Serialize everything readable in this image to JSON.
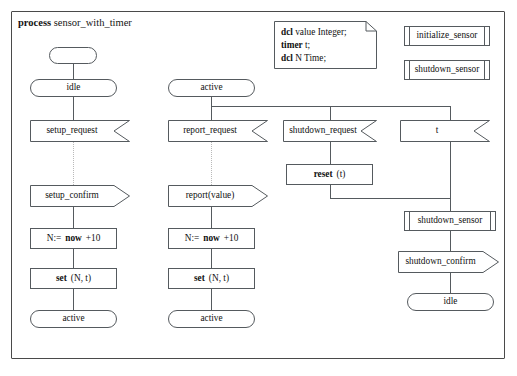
{
  "diagram": {
    "kind": "sdl-process-diagram",
    "header": {
      "keyword": "process",
      "name": "sensor_with_timer"
    },
    "declaration_note": {
      "lines": [
        {
          "keyword": "dcl",
          "text": "value Integer;"
        },
        {
          "keyword": "timer",
          "text": "t;"
        },
        {
          "keyword": "dcl",
          "text": "N Time;"
        }
      ]
    },
    "procedure_refs": [
      {
        "label": "initialize_sensor"
      },
      {
        "label": "shutdown_sensor"
      }
    ],
    "branches": {
      "setup": {
        "start": "",
        "state_in": "idle",
        "input": "setup_request",
        "output": "setup_confirm",
        "task_assign_prefix": "N:=",
        "task_assign_keyword": "now",
        "task_assign_suffix": "+10",
        "task_set_keyword": "set",
        "task_set_args": "(N, t)",
        "state_out": "active"
      },
      "report": {
        "state_in": "active",
        "input": "report_request",
        "output": "report(value)",
        "task_assign_prefix": "N:=",
        "task_assign_keyword": "now",
        "task_assign_suffix": "+10",
        "task_set_keyword": "set",
        "task_set_args": "(N, t)",
        "state_out": "active"
      },
      "shutdown": {
        "input": "shutdown_request",
        "task_reset_keyword": "reset",
        "task_reset_args": "(t)"
      },
      "timer": {
        "input": "t",
        "procedure_call": "shutdown_sensor",
        "output": "shutdown_confirm",
        "state_out": "idle"
      }
    },
    "colors": {
      "frame": "#4a4a4a",
      "symbol_stroke": "#555a5e",
      "text": "#111111",
      "dotted_connector": "#b9b9b9",
      "background": "#ffffff"
    }
  }
}
